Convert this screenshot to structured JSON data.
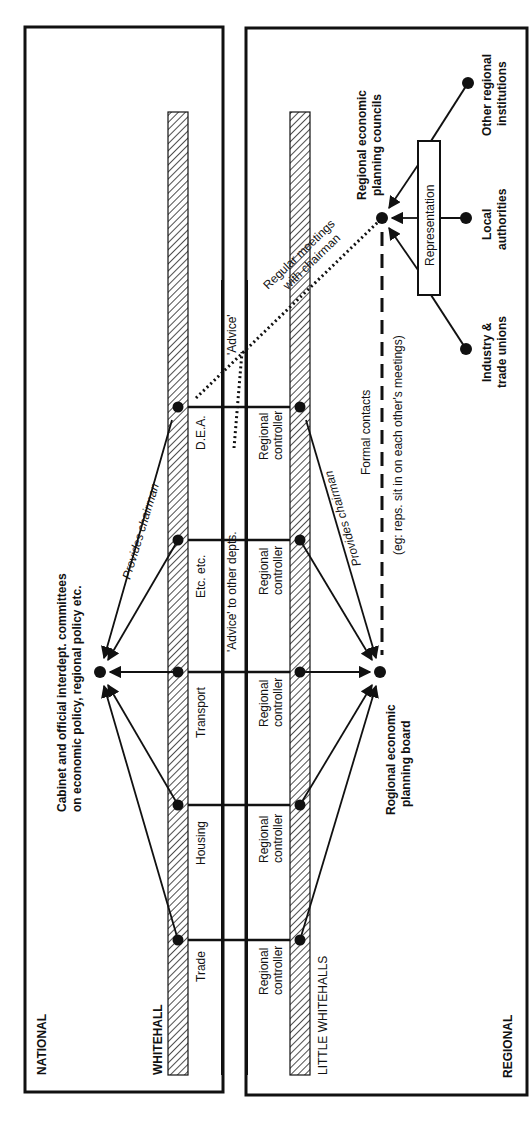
{
  "zones": {
    "national": "NATIONAL",
    "regional": "REGIONAL",
    "whitehall": "WHITEHALL",
    "little_whitehalls": "LITTLE  WHITEHALLS"
  },
  "departments": [
    {
      "label": "D.E.A."
    },
    {
      "label": "Etc. etc."
    },
    {
      "label": "Transport"
    },
    {
      "label": "Housing"
    },
    {
      "label": "Trade"
    }
  ],
  "controllers": {
    "line1": "Regional",
    "line2": "controller"
  },
  "cabinet": {
    "line1": "Cabinet and official interdept. committees",
    "line2": "on economic policy, regional policy etc."
  },
  "board": {
    "line1": "Rogional economic",
    "line2": "planning board"
  },
  "councils": {
    "line1": "Regional economic",
    "line2": "planning councils"
  },
  "representation": "Representation",
  "stakeholders": {
    "other": {
      "line1": "Other regional",
      "line2": "institutions"
    },
    "local": {
      "line1": "Local",
      "line2": "authorities"
    },
    "industry": {
      "line1": "Industry &",
      "line2": "trade unions"
    }
  },
  "edge_labels": {
    "provides_chairman_top": "Provides chairman",
    "provides_chairman_bottom": "Provides chairman",
    "advice_other_depts": "'Advice' to other depts.",
    "advice": "'Advice'",
    "regular_meetings_1": "Regular meetings",
    "regular_meetings_2": "with chairman",
    "formal_contacts_1": "Formal contacts",
    "formal_contacts_2": "(eg: reps. sit in on each other's meetings)"
  },
  "colors": {
    "ink": "#111111",
    "background": "#ffffff"
  }
}
